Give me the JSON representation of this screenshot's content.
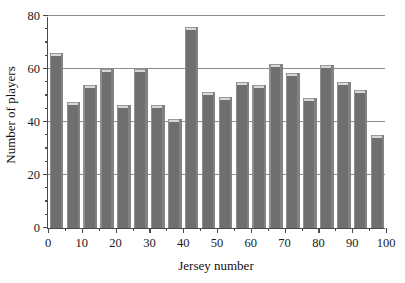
{
  "chart_data": {
    "type": "bar",
    "title": "",
    "xlabel": "Jersey number",
    "ylabel": "Number of players",
    "xlim": [
      0,
      100
    ],
    "ylim": [
      0,
      80
    ],
    "grid": true,
    "legend": null,
    "bin_width": 5,
    "xticks": [
      0,
      10,
      20,
      30,
      40,
      50,
      60,
      70,
      80,
      90,
      100
    ],
    "xtick_labels": [
      "0",
      "10",
      "20",
      "30",
      "40",
      "50",
      "60",
      "70",
      "80",
      "90",
      "100"
    ],
    "xticks_minor": [
      5,
      15,
      25,
      35,
      45,
      55,
      65,
      75,
      85,
      95
    ],
    "yticks": [
      0,
      20,
      40,
      60,
      80
    ],
    "ytick_labels": [
      "0",
      "20",
      "40",
      "60",
      "80"
    ],
    "yticks_minor": [
      5,
      10,
      15,
      25,
      30,
      35,
      45,
      50,
      55,
      65,
      70,
      75
    ],
    "bar_color": "#6f6f6f",
    "bar_top_color": "#d8d8d8",
    "grid_color": "#8c8c8c",
    "axis_color": "#4a4a4a",
    "categories": [
      "0-5",
      "5-10",
      "10-15",
      "15-20",
      "20-25",
      "25-30",
      "30-35",
      "35-40",
      "40-45",
      "45-50",
      "50-55",
      "55-60",
      "60-65",
      "65-70",
      "70-75",
      "75-80",
      "80-85",
      "85-90",
      "90-95",
      "95-100"
    ],
    "bin_starts": [
      0,
      5,
      10,
      15,
      20,
      25,
      30,
      35,
      40,
      45,
      50,
      55,
      60,
      65,
      70,
      75,
      80,
      85,
      90,
      95
    ],
    "values": [
      66,
      47.5,
      54,
      60,
      46.5,
      60,
      46.5,
      41,
      76,
      51.5,
      49.5,
      55,
      54,
      62,
      58.5,
      49,
      61.5,
      55,
      52,
      35
    ]
  }
}
